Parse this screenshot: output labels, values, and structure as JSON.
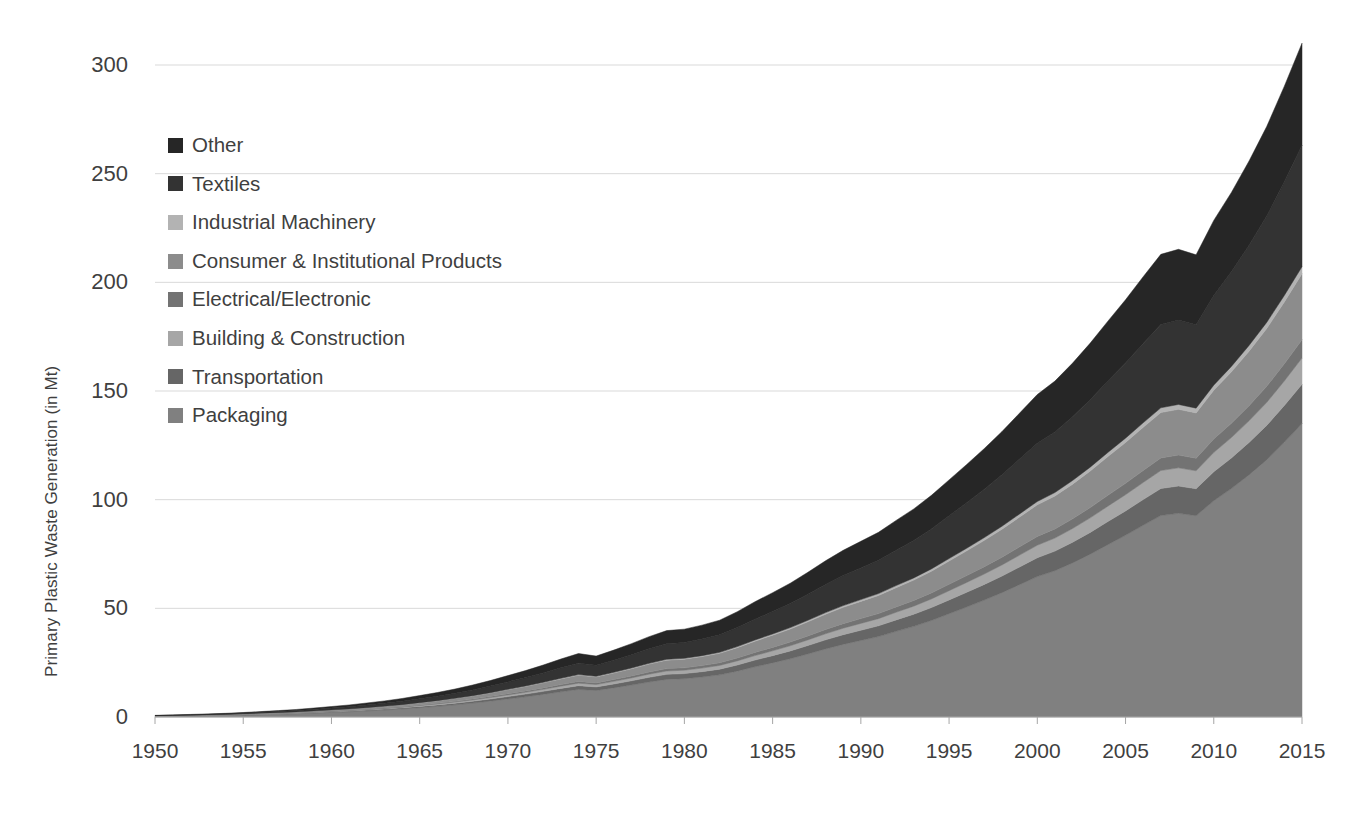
{
  "chart_data": {
    "type": "area",
    "stacked": true,
    "title": "",
    "xlabel": "",
    "ylabel": "Primary Plastic Waste Generation (in Mt)",
    "ylim": [
      0,
      300
    ],
    "xlim": [
      1950,
      2015
    ],
    "yticks": [
      0,
      50,
      100,
      150,
      200,
      250,
      300
    ],
    "xticks": [
      1950,
      1955,
      1960,
      1965,
      1970,
      1975,
      1980,
      1985,
      1990,
      1995,
      2000,
      2005,
      2010,
      2015
    ],
    "grid": true,
    "legend_position": "inside-top-left",
    "legend_order_top_to_bottom": [
      "Other",
      "Textiles",
      "Industrial Machinery",
      "Consumer & Institutional Products",
      "Electrical/Electronic",
      "Building & Construction",
      "Transportation",
      "Packaging"
    ],
    "x": [
      1950,
      1951,
      1952,
      1953,
      1954,
      1955,
      1956,
      1957,
      1958,
      1959,
      1960,
      1961,
      1962,
      1963,
      1964,
      1965,
      1966,
      1967,
      1968,
      1969,
      1970,
      1971,
      1972,
      1973,
      1974,
      1975,
      1976,
      1977,
      1978,
      1979,
      1980,
      1981,
      1982,
      1983,
      1984,
      1985,
      1986,
      1987,
      1988,
      1989,
      1990,
      1991,
      1992,
      1993,
      1994,
      1995,
      1996,
      1997,
      1998,
      1999,
      2000,
      2001,
      2002,
      2003,
      2004,
      2005,
      2006,
      2007,
      2008,
      2009,
      2010,
      2011,
      2012,
      2013,
      2014,
      2015
    ],
    "series": [
      {
        "name": "Packaging",
        "color": "#808080",
        "values": [
          0.3,
          0.4,
          0.5,
          0.6,
          0.7,
          0.9,
          1.1,
          1.3,
          1.5,
          1.8,
          2.1,
          2.4,
          2.8,
          3.2,
          3.7,
          4.3,
          4.9,
          5.6,
          6.4,
          7.3,
          8.3,
          9.3,
          10.4,
          11.6,
          12.7,
          12.2,
          13.4,
          14.7,
          16.1,
          17.3,
          17.6,
          18.4,
          19.4,
          21.1,
          23.1,
          24.9,
          26.8,
          29.0,
          31.3,
          33.4,
          35.2,
          37.0,
          39.4,
          41.7,
          44.4,
          47.5,
          50.6,
          53.8,
          57.2,
          60.9,
          64.6,
          67.3,
          70.9,
          74.9,
          79.3,
          83.6,
          88.2,
          92.7,
          93.7,
          92.6,
          99.5,
          105.1,
          111.4,
          118.3,
          126.4,
          135.0
        ]
      },
      {
        "name": "Transportation",
        "color": "#666666",
        "values": [
          0.05,
          0.06,
          0.07,
          0.09,
          0.11,
          0.13,
          0.15,
          0.18,
          0.21,
          0.25,
          0.29,
          0.33,
          0.38,
          0.44,
          0.5,
          0.58,
          0.66,
          0.75,
          0.86,
          0.98,
          1.11,
          1.25,
          1.4,
          1.56,
          1.71,
          1.64,
          1.8,
          1.97,
          2.16,
          2.32,
          2.36,
          2.47,
          2.6,
          2.83,
          3.1,
          3.34,
          3.59,
          3.89,
          4.2,
          4.48,
          4.72,
          4.96,
          5.28,
          5.59,
          5.96,
          6.37,
          6.79,
          7.22,
          7.67,
          8.17,
          8.67,
          9.03,
          9.51,
          10.05,
          10.64,
          11.21,
          11.83,
          12.43,
          12.57,
          12.42,
          13.34,
          14.1,
          14.94,
          15.87,
          16.95,
          18.1
        ]
      },
      {
        "name": "Building & Construction",
        "color": "#a6a6a6",
        "values": [
          0.03,
          0.04,
          0.05,
          0.06,
          0.07,
          0.08,
          0.1,
          0.12,
          0.14,
          0.16,
          0.19,
          0.22,
          0.25,
          0.29,
          0.33,
          0.38,
          0.44,
          0.5,
          0.57,
          0.65,
          0.74,
          0.83,
          0.93,
          1.04,
          1.14,
          1.09,
          1.2,
          1.31,
          1.44,
          1.55,
          1.57,
          1.64,
          1.73,
          1.89,
          2.06,
          2.22,
          2.39,
          2.59,
          2.79,
          2.98,
          3.14,
          3.3,
          3.51,
          3.72,
          3.96,
          4.24,
          4.52,
          4.8,
          5.1,
          5.43,
          5.77,
          6.01,
          6.33,
          6.69,
          7.08,
          7.46,
          7.87,
          8.27,
          8.36,
          8.26,
          8.88,
          9.38,
          9.94,
          10.56,
          11.28,
          12.05
        ]
      },
      {
        "name": "Electrical/Electronic",
        "color": "#737373",
        "values": [
          0.02,
          0.03,
          0.03,
          0.04,
          0.05,
          0.06,
          0.07,
          0.08,
          0.1,
          0.12,
          0.13,
          0.15,
          0.18,
          0.2,
          0.23,
          0.27,
          0.31,
          0.35,
          0.4,
          0.46,
          0.52,
          0.58,
          0.65,
          0.73,
          0.8,
          0.77,
          0.84,
          0.92,
          1.01,
          1.09,
          1.1,
          1.15,
          1.22,
          1.32,
          1.45,
          1.56,
          1.68,
          1.82,
          1.96,
          2.09,
          2.21,
          2.32,
          2.47,
          2.61,
          2.78,
          2.97,
          3.17,
          3.37,
          3.58,
          3.81,
          4.05,
          4.22,
          4.45,
          4.7,
          4.97,
          5.24,
          5.53,
          5.81,
          5.87,
          5.8,
          6.23,
          6.59,
          6.98,
          7.41,
          7.92,
          8.46
        ]
      },
      {
        "name": "Consumer & Institutional Products",
        "color": "#8c8c8c",
        "values": [
          0.08,
          0.1,
          0.12,
          0.14,
          0.17,
          0.2,
          0.24,
          0.29,
          0.34,
          0.4,
          0.47,
          0.54,
          0.63,
          0.72,
          0.83,
          0.96,
          1.1,
          1.26,
          1.44,
          1.64,
          1.86,
          2.09,
          2.34,
          2.61,
          2.86,
          2.74,
          3.01,
          3.3,
          3.62,
          3.89,
          3.96,
          4.14,
          4.36,
          4.75,
          5.19,
          5.6,
          6.03,
          6.52,
          7.04,
          7.51,
          7.92,
          8.32,
          8.86,
          9.38,
          9.99,
          10.69,
          11.38,
          12.1,
          12.87,
          13.7,
          14.53,
          15.14,
          15.95,
          16.85,
          17.84,
          18.8,
          19.84,
          20.85,
          21.08,
          20.83,
          22.38,
          23.64,
          25.06,
          26.61,
          28.43,
          30.37
        ]
      },
      {
        "name": "Industrial Machinery",
        "color": "#b3b3b3",
        "values": [
          0.01,
          0.01,
          0.01,
          0.02,
          0.02,
          0.02,
          0.03,
          0.03,
          0.04,
          0.04,
          0.05,
          0.06,
          0.07,
          0.08,
          0.09,
          0.1,
          0.12,
          0.13,
          0.15,
          0.17,
          0.2,
          0.22,
          0.25,
          0.28,
          0.3,
          0.29,
          0.32,
          0.35,
          0.38,
          0.41,
          0.42,
          0.44,
          0.46,
          0.5,
          0.55,
          0.59,
          0.64,
          0.69,
          0.74,
          0.79,
          0.84,
          0.88,
          0.94,
          0.99,
          1.06,
          1.13,
          1.2,
          1.28,
          1.36,
          1.45,
          1.54,
          1.6,
          1.69,
          1.78,
          1.89,
          1.99,
          2.1,
          2.21,
          2.23,
          2.2,
          2.37,
          2.5,
          2.65,
          2.82,
          3.01,
          3.21
        ]
      },
      {
        "name": "Textiles",
        "color": "#333333",
        "values": [
          0.15,
          0.18,
          0.22,
          0.26,
          0.31,
          0.37,
          0.44,
          0.52,
          0.62,
          0.73,
          0.86,
          1.0,
          1.16,
          1.34,
          1.54,
          1.77,
          2.03,
          2.32,
          2.65,
          3.02,
          3.43,
          3.85,
          4.31,
          4.81,
          5.27,
          5.05,
          5.55,
          6.09,
          6.67,
          7.17,
          7.29,
          7.62,
          8.03,
          8.74,
          9.56,
          10.31,
          11.1,
          12.01,
          12.96,
          13.83,
          14.58,
          15.32,
          16.31,
          17.27,
          18.39,
          19.68,
          20.95,
          22.28,
          23.69,
          25.22,
          26.76,
          27.87,
          29.36,
          31.02,
          32.84,
          34.61,
          36.53,
          38.38,
          38.81,
          38.35,
          41.21,
          43.52,
          46.13,
          48.99,
          52.34,
          55.91
        ]
      },
      {
        "name": "Other",
        "color": "#262626",
        "values": [
          0.12,
          0.15,
          0.18,
          0.22,
          0.26,
          0.31,
          0.37,
          0.44,
          0.52,
          0.61,
          0.72,
          0.84,
          0.97,
          1.12,
          1.29,
          1.49,
          1.7,
          1.95,
          2.23,
          2.54,
          2.88,
          3.23,
          3.62,
          4.04,
          4.43,
          4.24,
          4.66,
          5.11,
          5.6,
          6.02,
          6.12,
          6.4,
          6.74,
          7.34,
          8.03,
          8.66,
          9.32,
          10.08,
          10.88,
          11.61,
          12.24,
          12.86,
          13.69,
          14.5,
          15.44,
          16.52,
          17.59,
          18.7,
          19.89,
          21.17,
          22.46,
          23.4,
          24.64,
          26.04,
          27.57,
          29.06,
          30.67,
          32.22,
          32.58,
          32.19,
          34.59,
          36.53,
          38.72,
          41.13,
          43.94,
          46.93
        ]
      }
    ]
  }
}
